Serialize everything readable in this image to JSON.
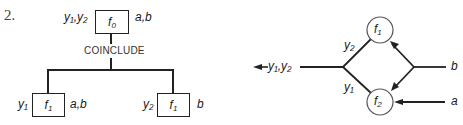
{
  "item_number": "2.",
  "tree_diagram": {
    "root": {
      "function": "f",
      "function_sub": "0",
      "outputs": "y₁,y₂",
      "inputs": "a,b"
    },
    "connector_label": "COINCLUDE",
    "children": [
      {
        "function": "f",
        "function_sub": "1",
        "outputs": "y₁",
        "inputs": "a,b"
      },
      {
        "function": "f",
        "function_sub": "1",
        "outputs": "y₂",
        "inputs": "b"
      }
    ]
  },
  "flow_diagram": {
    "nodes": [
      {
        "id": "f1",
        "function": "f",
        "function_sub": "1"
      },
      {
        "id": "f2",
        "function": "f",
        "function_sub": "2"
      }
    ],
    "output_label": "y₁,y₂",
    "branch_labels": {
      "upper": "y₂",
      "lower": "y₁"
    },
    "inputs": {
      "b": "b",
      "a": "a"
    }
  },
  "colors": {
    "line": "#222222",
    "text": "#1a1a1a",
    "background": "#ffffff"
  }
}
